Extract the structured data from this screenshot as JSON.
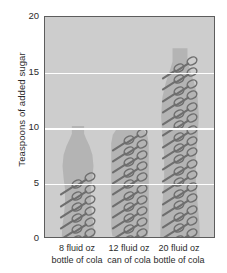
{
  "chart_data": {
    "type": "bar",
    "title": "",
    "xlabel": "",
    "ylabel": "Teaspoons of added sugar",
    "ylim": [
      0,
      20
    ],
    "yticks": [
      0,
      5,
      10,
      15,
      20
    ],
    "ytick_labels": [
      "0",
      "5",
      "10",
      "15",
      "20"
    ],
    "grid": true,
    "gridlines_at": [
      5,
      10,
      15
    ],
    "legend": "none",
    "categories": [
      "8 fluid oz bottle of cola",
      "12 fluid oz can of cola",
      "20 fluid oz bottle of cola"
    ],
    "values": [
      6,
      10,
      16.5
    ],
    "units": "teaspoons of added sugar",
    "pictogram": "teaspoon",
    "series": [
      {
        "name": "Teaspoons of added sugar",
        "values": [
          6,
          10,
          16.5
        ]
      }
    ]
  },
  "axis": {
    "y_title": "Teaspoons of added sugar",
    "ticks": [
      {
        "value": 20,
        "label": "20"
      },
      {
        "value": 15,
        "label": "15"
      },
      {
        "value": 10,
        "label": "10"
      },
      {
        "value": 5,
        "label": "5"
      },
      {
        "value": 0,
        "label": "0"
      }
    ]
  },
  "columns": [
    {
      "id": "col-8oz-bottle",
      "shape": "bottle",
      "label_line1": "8 fluid oz",
      "label_line2": "bottle of cola",
      "value": 6,
      "vessel_top": 10,
      "spoon_rows": 6
    },
    {
      "id": "col-12oz-can",
      "shape": "can",
      "label_line1": "12 fluid oz",
      "label_line2": "can of cola",
      "value": 10,
      "vessel_top": 9.8,
      "spoon_rows": 10
    },
    {
      "id": "col-20oz-bottle",
      "shape": "bottle",
      "label_line1": "20 fluid oz",
      "label_line2": "bottle of cola",
      "value": 16.5,
      "vessel_top": 17,
      "spoon_rows": 16
    }
  ],
  "colors": {
    "plot_background": "#cdcdcd",
    "vessel_fill": "#b4b4b4",
    "gridline": "#ffffff",
    "frame": "#5d5d5d",
    "spoon_stroke": "#6e6e6e",
    "text": "#2b2b2b",
    "page_background": "#ffffff"
  }
}
